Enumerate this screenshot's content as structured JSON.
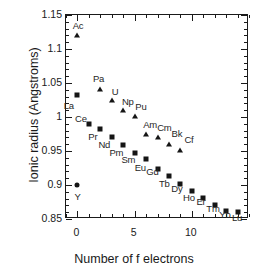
{
  "chart_data": {
    "type": "scatter",
    "title": "",
    "xlabel": "Number of f electrons",
    "ylabel": "Ionic radius (Angstroms)",
    "xlim": [
      -1,
      15
    ],
    "ylim": [
      0.85,
      1.15
    ],
    "xticks": [
      0,
      5,
      10
    ],
    "xtick_labels": [
      "0",
      "5",
      "10"
    ],
    "xtick_minor_step": 1,
    "yticks": [
      0.85,
      0.9,
      0.95,
      1.0,
      1.05,
      1.1,
      1.15
    ],
    "ytick_labels": [
      "0.85",
      "0.9",
      "0.95",
      "1",
      "1.05",
      "1.1",
      "1.15"
    ],
    "ytick_minor_step": 0.01,
    "grid": false,
    "legend": null,
    "series": [
      {
        "name": "Lanthanides",
        "marker": "square",
        "points": [
          {
            "label": "La",
            "x": 0,
            "y": 1.033,
            "lx": -0.75,
            "ly": 1.018
          },
          {
            "label": "Ce",
            "x": 1,
            "y": 0.99,
            "lx": 0.3,
            "ly": 0.999
          },
          {
            "label": "Pr",
            "x": 2,
            "y": 0.983,
            "lx": 1.35,
            "ly": 0.972
          },
          {
            "label": "Nd",
            "x": 3,
            "y": 0.971,
            "lx": 2.35,
            "ly": 0.961
          },
          {
            "label": "Pm",
            "x": 4,
            "y": 0.959,
            "lx": 3.4,
            "ly": 0.948
          },
          {
            "label": "Sm",
            "x": 5,
            "y": 0.947,
            "lx": 4.45,
            "ly": 0.938
          },
          {
            "label": "Eu",
            "x": 6,
            "y": 0.938,
            "lx": 5.5,
            "ly": 0.926
          },
          {
            "label": "Gd",
            "x": 7,
            "y": 0.923,
            "lx": 6.55,
            "ly": 0.92
          },
          {
            "label": "Tb",
            "x": 8,
            "y": 0.913,
            "lx": 7.6,
            "ly": 0.903
          },
          {
            "label": "Dy",
            "x": 9,
            "y": 0.901,
            "lx": 8.7,
            "ly": 0.896
          },
          {
            "label": "Ho",
            "x": 10,
            "y": 0.891,
            "lx": 9.75,
            "ly": 0.883
          },
          {
            "label": "Er",
            "x": 11,
            "y": 0.881,
            "lx": 10.8,
            "ly": 0.876
          },
          {
            "label": "Tm",
            "x": 12,
            "y": 0.87,
            "lx": 11.85,
            "ly": 0.866
          },
          {
            "label": "Yb",
            "x": 13,
            "y": 0.862,
            "lx": 12.9,
            "ly": 0.857
          },
          {
            "label": "Lu",
            "x": 14,
            "y": 0.861,
            "lx": 13.95,
            "ly": 0.853
          }
        ]
      },
      {
        "name": "Actinides",
        "marker": "triangle",
        "points": [
          {
            "label": "Ac",
            "x": 0,
            "y": 1.12,
            "lx": 0.05,
            "ly": 1.136
          },
          {
            "label": "Pa",
            "x": 2,
            "y": 1.041,
            "lx": 1.85,
            "ly": 1.057
          },
          {
            "label": "U",
            "x": 3,
            "y": 1.025,
            "lx": 3.3,
            "ly": 1.038
          },
          {
            "label": "Np",
            "x": 4,
            "y": 1.01,
            "lx": 4.4,
            "ly": 1.024
          },
          {
            "label": "Pu",
            "x": 5,
            "y": 1.001,
            "lx": 5.55,
            "ly": 1.016
          },
          {
            "label": "Am",
            "x": 6,
            "y": 0.975,
            "lx": 6.35,
            "ly": 0.99
          },
          {
            "label": "Cm",
            "x": 7,
            "y": 0.971,
            "lx": 7.6,
            "ly": 0.985
          },
          {
            "label": "Bk",
            "x": 8,
            "y": 0.961,
            "lx": 8.7,
            "ly": 0.976
          },
          {
            "label": "Cf",
            "x": 9,
            "y": 0.951,
            "lx": 9.75,
            "ly": 0.967
          }
        ]
      },
      {
        "name": "Yttrium",
        "marker": "circle",
        "points": [
          {
            "label": "Y",
            "x": 0,
            "y": 0.9,
            "lx": 0.02,
            "ly": 0.884
          }
        ]
      }
    ]
  }
}
